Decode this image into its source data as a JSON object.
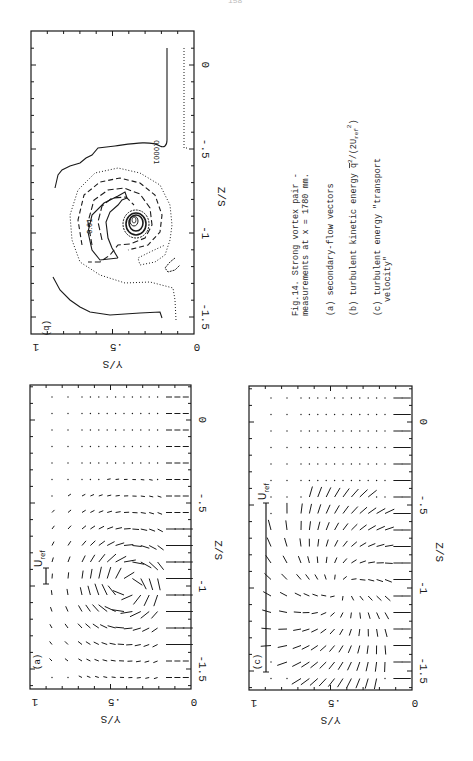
{
  "page": {
    "number": "158"
  },
  "caption": {
    "title_line1": "Fig.14. Strong vortex pair -",
    "title_line2": "measurements at x = 1780 mm.",
    "item_a": "(a) secondary-flow vectors",
    "item_b_text": "(b) turbulent kinetic energy ",
    "item_b_symbol": "q",
    "item_b_sup": "2",
    "item_b_tail": "/(2U",
    "item_b_sub": "ref",
    "item_b_sup2": "2",
    "item_b_close": ")",
    "item_c_line1": "(c) turbulent energy \"transport",
    "item_c_line2": "velocity\""
  },
  "panels": {
    "a": {
      "label": "(a)",
      "uref_label": "U",
      "uref_sub": "ref"
    },
    "b": {
      "label": "(b)",
      "contour_label_outer": "0.0001",
      "contour_label_inner": "0.01"
    },
    "c": {
      "label": "(c)",
      "uref_label": "U",
      "uref_sub": "ref"
    }
  },
  "axes": {
    "x_label": "Y/S",
    "z_label": "Z/S",
    "y_ticks": [
      "1",
      ".5",
      "0"
    ],
    "z_ticks": [
      "0",
      "-.5",
      "-1",
      "-1.5"
    ]
  },
  "chart_data": [
    {
      "type": "vector-field",
      "title": "(a) secondary-flow vectors",
      "xlabel": "Y/S",
      "ylabel": "Z/S",
      "xlim": [
        1,
        0
      ],
      "ylim": [
        -1.6,
        0.25
      ],
      "annotations": [
        "U_ref reference vector (short)",
        "vortex centre near Z/S=-0.95, Y/S=0.45"
      ]
    },
    {
      "type": "contour",
      "title": "(b) turbulent kinetic energy q^2/(2U_ref^2)",
      "xlabel": "Y/S",
      "ylabel": "Z/S",
      "xlim": [
        1,
        0
      ],
      "ylim": [
        -1.6,
        0.25
      ],
      "contour_levels_labeled": [
        0.0001,
        0.01
      ],
      "annotations": [
        "peak concentration near Z/S=-0.95, Y/S=0.35"
      ]
    },
    {
      "type": "vector-field",
      "title": "(c) turbulent energy \"transport velocity\"",
      "xlabel": "Y/S",
      "ylabel": "Z/S",
      "xlim": [
        1,
        0
      ],
      "ylim": [
        -1.6,
        0.25
      ],
      "annotations": [
        "U_ref reference vector (long)"
      ]
    }
  ]
}
